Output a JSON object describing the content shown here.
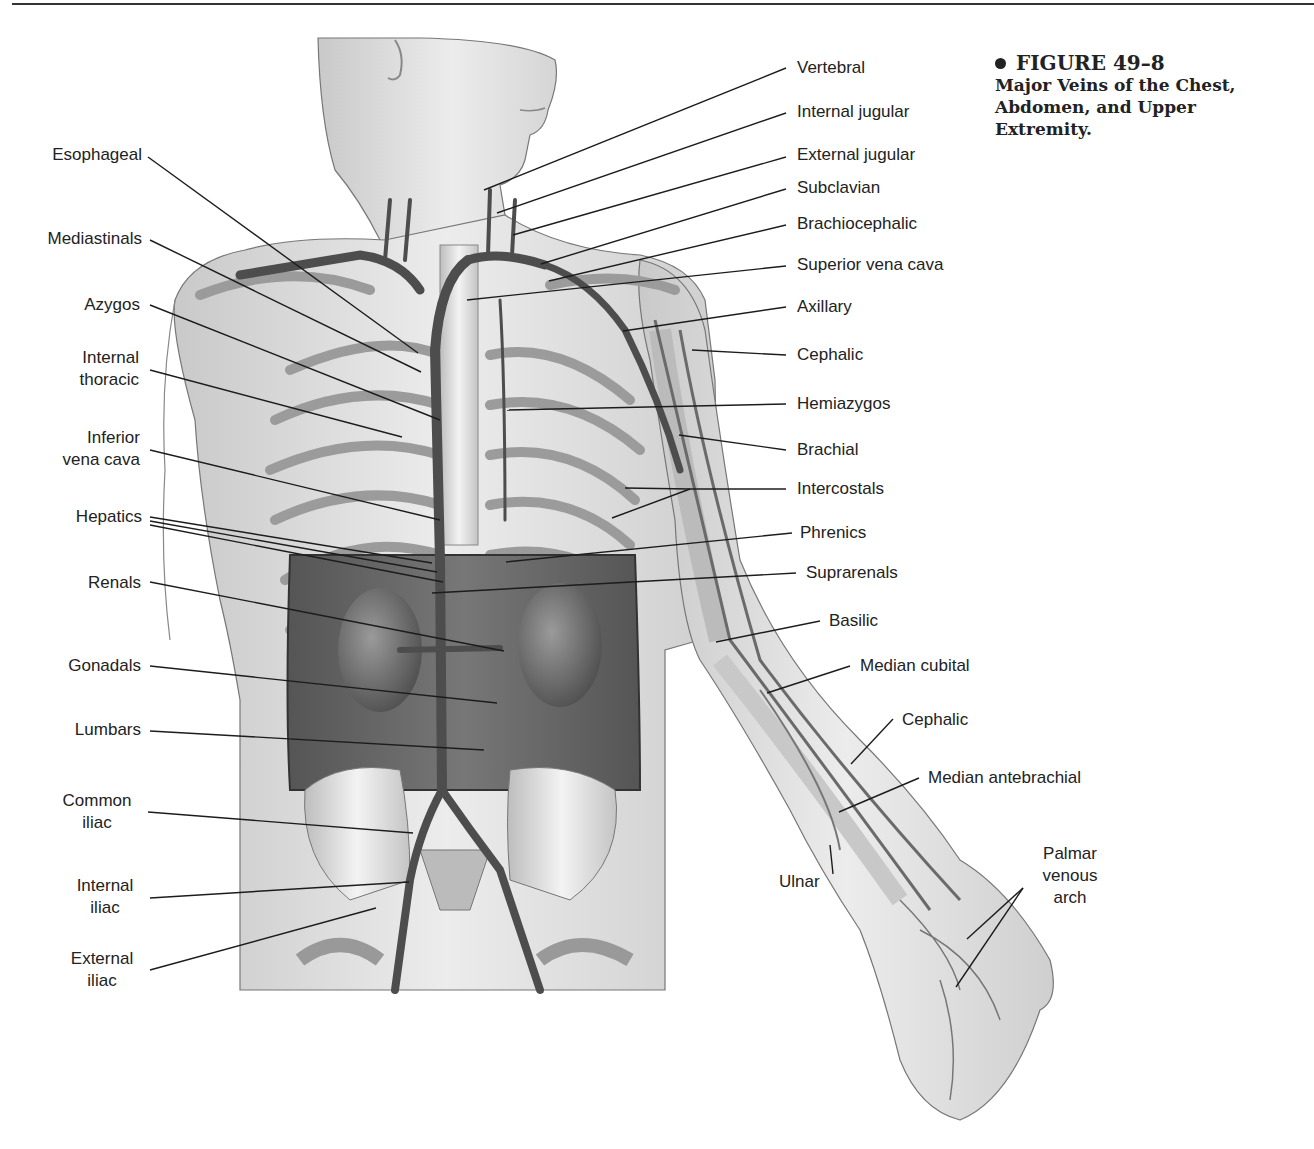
{
  "figure": {
    "number": "FIGURE 49–8",
    "title_lines": [
      "Major Veins of the Chest,",
      "Abdomen, and Upper",
      "Extremity."
    ]
  },
  "labels_left": [
    {
      "id": "esophageal",
      "lines": [
        "Esophageal"
      ]
    },
    {
      "id": "mediastinals",
      "lines": [
        "Mediastinals"
      ]
    },
    {
      "id": "azygos",
      "lines": [
        "Azygos"
      ]
    },
    {
      "id": "internal-thoracic",
      "lines": [
        "Internal",
        "thoracic"
      ]
    },
    {
      "id": "inferior-vena-cava",
      "lines": [
        "Inferior",
        "vena cava"
      ]
    },
    {
      "id": "hepatics",
      "lines": [
        "Hepatics"
      ]
    },
    {
      "id": "renals",
      "lines": [
        "Renals"
      ]
    },
    {
      "id": "gonadals",
      "lines": [
        "Gonadals"
      ]
    },
    {
      "id": "lumbars",
      "lines": [
        "Lumbars"
      ]
    },
    {
      "id": "common-iliac",
      "lines": [
        "Common",
        "iliac"
      ]
    },
    {
      "id": "internal-iliac",
      "lines": [
        "Internal",
        "iliac"
      ]
    },
    {
      "id": "external-iliac",
      "lines": [
        "External",
        "iliac"
      ]
    }
  ],
  "labels_right": [
    {
      "id": "vertebral",
      "lines": [
        "Vertebral"
      ]
    },
    {
      "id": "internal-jugular",
      "lines": [
        "Internal jugular"
      ]
    },
    {
      "id": "external-jugular",
      "lines": [
        "External jugular"
      ]
    },
    {
      "id": "subclavian",
      "lines": [
        "Subclavian"
      ]
    },
    {
      "id": "brachiocephalic",
      "lines": [
        "Brachiocephalic"
      ]
    },
    {
      "id": "superior-vena-cava",
      "lines": [
        "Superior vena cava"
      ]
    },
    {
      "id": "axillary",
      "lines": [
        "Axillary"
      ]
    },
    {
      "id": "cephalic-upper",
      "lines": [
        "Cephalic"
      ]
    },
    {
      "id": "hemiazygos",
      "lines": [
        "Hemiazygos"
      ]
    },
    {
      "id": "brachial",
      "lines": [
        "Brachial"
      ]
    },
    {
      "id": "intercostals",
      "lines": [
        "Intercostals"
      ]
    },
    {
      "id": "phrenics",
      "lines": [
        "Phrenics"
      ]
    },
    {
      "id": "suprarenals",
      "lines": [
        "Suprarenals"
      ]
    },
    {
      "id": "basilic",
      "lines": [
        "Basilic"
      ]
    },
    {
      "id": "median-cubital",
      "lines": [
        "Median cubital"
      ]
    },
    {
      "id": "cephalic-forearm",
      "lines": [
        "Cephalic"
      ]
    },
    {
      "id": "median-antebrachial",
      "lines": [
        "Median antebrachial"
      ]
    },
    {
      "id": "ulnar",
      "lines": [
        "Ulnar"
      ]
    },
    {
      "id": "palmar-venous-arch",
      "lines": [
        "Palmar",
        "venous",
        "arch"
      ]
    }
  ]
}
